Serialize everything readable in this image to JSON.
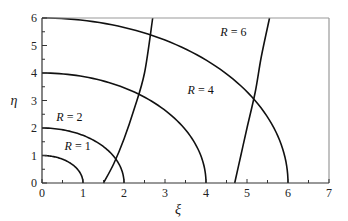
{
  "chart_data": {
    "type": "line",
    "title": "",
    "xlabel": "ξ",
    "ylabel": "η",
    "xlim": [
      0,
      7
    ],
    "ylim": [
      0,
      6
    ],
    "x_ticks": [
      0,
      1,
      2,
      3,
      4,
      5,
      6,
      7
    ],
    "y_ticks": [
      0,
      1,
      2,
      3,
      4,
      5,
      6
    ],
    "x_minor_step": 0.5,
    "y_minor_step": 0.5,
    "grid": false,
    "series": [
      {
        "name": "R = 1",
        "kind": "quarter-circle",
        "radius": 1
      },
      {
        "name": "R = 2",
        "kind": "quarter-circle",
        "radius": 2
      },
      {
        "name": "R = 4",
        "kind": "quarter-circle",
        "radius": 4
      },
      {
        "name": "R = 6",
        "kind": "quarter-circle",
        "radius": 6
      },
      {
        "name": "curve-A",
        "kind": "steep-curve",
        "points": [
          [
            1.5,
            0
          ],
          [
            1.75,
            0.7
          ],
          [
            2.0,
            1.6
          ],
          [
            2.25,
            2.7
          ],
          [
            2.5,
            4.0
          ],
          [
            2.7,
            6.0
          ]
        ]
      },
      {
        "name": "curve-B",
        "kind": "steep-curve",
        "points": [
          [
            4.7,
            0
          ],
          [
            4.85,
            1.0
          ],
          [
            5.0,
            2.0
          ],
          [
            5.2,
            3.3
          ],
          [
            5.35,
            4.6
          ],
          [
            5.55,
            6.0
          ]
        ]
      }
    ],
    "annotations": [
      {
        "text": "R = 1",
        "x": 0.55,
        "y": 1.2
      },
      {
        "text": "R = 2",
        "x": 0.35,
        "y": 2.25
      },
      {
        "text": "R = 4",
        "x": 3.55,
        "y": 3.25
      },
      {
        "text": "R = 6",
        "x": 4.35,
        "y": 5.35
      }
    ]
  },
  "labels": {
    "xlabel": "ξ",
    "ylabel": "η",
    "r1": "R = 1",
    "r2": "R = 2",
    "r4": "R = 4",
    "r6": "R = 6"
  }
}
